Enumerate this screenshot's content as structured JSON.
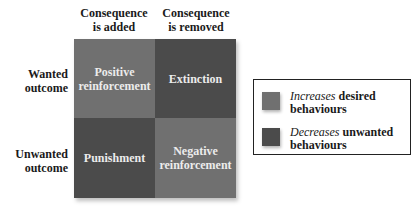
{
  "columns": [
    {
      "line1": "Consequence",
      "line2": "is added"
    },
    {
      "line1": "Consequence",
      "line2": "is removed"
    }
  ],
  "rows": [
    {
      "line1": "Wanted",
      "line2": "outcome"
    },
    {
      "line1": "Unwanted",
      "line2": "outcome"
    }
  ],
  "cells": [
    {
      "line1": "Positive",
      "line2": "reinforcement",
      "color": "#707070"
    },
    {
      "line1": "Extinction",
      "line2": "",
      "color": "#4b4b4b"
    },
    {
      "line1": "Punishment",
      "line2": "",
      "color": "#4b4b4b"
    },
    {
      "line1": "Negative",
      "line2": "reinforcement",
      "color": "#707070"
    }
  ],
  "legend": [
    {
      "emph": "Increases",
      "rest": " desired",
      "line2": "behaviours",
      "color": "#707070"
    },
    {
      "emph": "Decreases",
      "rest": " unwanted",
      "line2": "behaviours",
      "color": "#4b4b4b"
    }
  ]
}
